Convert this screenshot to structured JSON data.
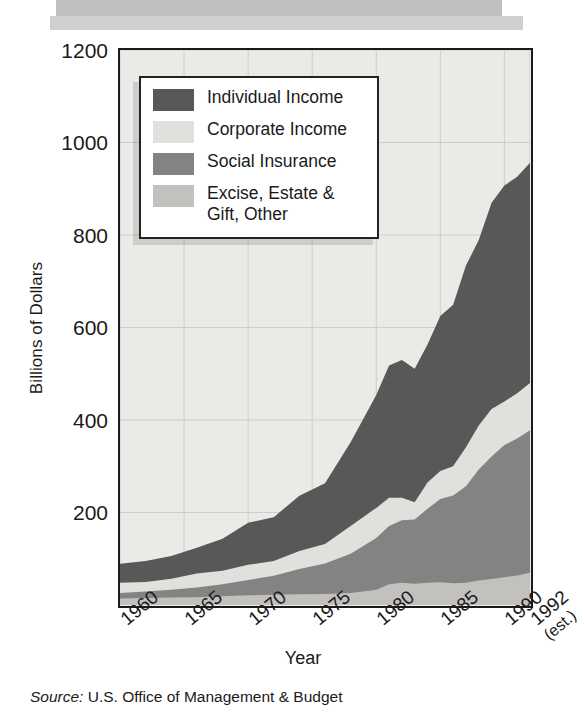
{
  "figure": {
    "source_prefix": "Source:",
    "source_text": " U.S. Office of Management & Budget"
  },
  "chart_data": {
    "type": "area",
    "stacked": true,
    "title": "",
    "xlabel": "Year",
    "ylabel": "Billions of Dollars",
    "xlim": [
      1960,
      1992
    ],
    "ylim": [
      0,
      1200
    ],
    "grid": true,
    "legend_position": "top-left",
    "ytick_labels": [
      "1200",
      "1000",
      "800",
      "600",
      "400",
      "200"
    ],
    "ytick_values": [
      1200,
      1000,
      800,
      600,
      400,
      200
    ],
    "xtick_labels": [
      "1960",
      "1965",
      "1970",
      "1975",
      "1980",
      "1985",
      "1990",
      "1992"
    ],
    "xtick_values": [
      1960,
      1965,
      1970,
      1975,
      1980,
      1985,
      1990,
      1992
    ],
    "xtick_note": "(est.)",
    "colors": {
      "individual_income": "#585858",
      "corporate_income": "#e2e0dd",
      "social_insurance": "#838383",
      "excise_estate_gift_other": "#c3c1bd",
      "plot_background": "#eceae7",
      "frame": "#1b1b1b",
      "gridline": "#cfcdc9"
    },
    "x": [
      1960,
      1962,
      1964,
      1966,
      1968,
      1970,
      1972,
      1974,
      1976,
      1978,
      1980,
      1981,
      1982,
      1983,
      1984,
      1985,
      1986,
      1987,
      1988,
      1989,
      1990,
      1991,
      1992
    ],
    "series": [
      {
        "name": "Excise, Estate & Gift, Other",
        "color": "#c3c1bd",
        "stack_order": 1,
        "values": [
          14,
          15,
          16,
          17,
          19,
          21,
          22,
          23,
          24,
          26,
          33,
          45,
          48,
          46,
          48,
          49,
          47,
          48,
          53,
          56,
          60,
          64,
          70
        ]
      },
      {
        "name": "Social Insurance",
        "color": "#838383",
        "stack_order": 2,
        "values": [
          12,
          14,
          17,
          21,
          26,
          33,
          41,
          55,
          66,
          85,
          112,
          126,
          135,
          139,
          160,
          180,
          190,
          209,
          240,
          265,
          286,
          296,
          308
        ]
      },
      {
        "name": "Corporate Income",
        "color": "#e2e0dd",
        "stack_order": 3,
        "values": [
          22,
          21,
          24,
          30,
          29,
          33,
          32,
          39,
          42,
          60,
          65,
          61,
          49,
          37,
          57,
          61,
          63,
          84,
          95,
          103,
          94,
          98,
          102
        ]
      },
      {
        "name": "Individual Income",
        "color": "#585858",
        "stack_order": 4,
        "values": [
          41,
          45,
          49,
          56,
          69,
          91,
          95,
          119,
          131,
          181,
          244,
          286,
          298,
          289,
          298,
          335,
          349,
          393,
          401,
          446,
          467,
          468,
          476
        ]
      }
    ],
    "totals": [
      89,
      95,
      106,
      124,
      143,
      178,
      190,
      236,
      263,
      352,
      454,
      518,
      530,
      511,
      563,
      625,
      649,
      734,
      789,
      870,
      907,
      926,
      956
    ]
  },
  "header": {
    "bar_top_color": "#c0c0c0",
    "bar_bottom_color": "#cfcfcf"
  }
}
